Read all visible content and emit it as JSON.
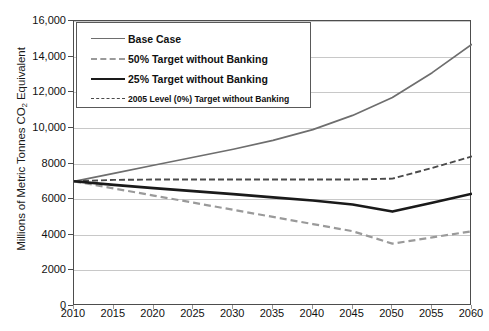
{
  "chart_data": {
    "type": "line",
    "title": "",
    "xlabel": "",
    "ylabel": "Millions of Metric Tonnes CO2 Equivalent",
    "ylabel_parts": {
      "pre": "Millions of Metric Tonnes CO",
      "sub": "2",
      "post": " Equivalent"
    },
    "xlim": [
      2010,
      2060
    ],
    "ylim": [
      0,
      16000
    ],
    "grid": true,
    "legend_position": "top-left-inside",
    "x": [
      2010,
      2015,
      2020,
      2025,
      2030,
      2035,
      2040,
      2045,
      2050,
      2055,
      2060
    ],
    "xticks": [
      "2010",
      "2015",
      "2020",
      "2025",
      "2030",
      "2035",
      "2040",
      "2045",
      "2050",
      "2055",
      "2060"
    ],
    "yticks": [
      "0",
      "2000",
      "4000",
      "6000",
      "8000",
      "10,000",
      "12,000",
      "14,000",
      "16,000"
    ],
    "ytick_values": [
      0,
      2000,
      4000,
      6000,
      8000,
      10000,
      12000,
      14000,
      16000
    ],
    "series": [
      {
        "name": "Base Case",
        "style": "solid",
        "color": "#6e6e6e",
        "width": 1.7,
        "values": [
          7000,
          7450,
          7900,
          8350,
          8800,
          9300,
          9900,
          10700,
          11700,
          13100,
          14700
        ]
      },
      {
        "name": "50% Target without Banking",
        "style": "dashed",
        "color": "#9a9a9a",
        "width": 2.2,
        "values": [
          7000,
          6600,
          6200,
          5800,
          5400,
          5000,
          4600,
          4200,
          3500,
          3850,
          4200
        ]
      },
      {
        "name": "25% Target without Banking",
        "style": "solid",
        "color": "#1a1a1a",
        "width": 2.6,
        "values": [
          7000,
          6800,
          6620,
          6450,
          6280,
          6100,
          5920,
          5700,
          5300,
          5800,
          6300
        ]
      },
      {
        "name": "2005 Level (0%) Target without Banking",
        "style": "dashed",
        "color": "#4a4a4a",
        "width": 1.9,
        "values": [
          7000,
          7080,
          7100,
          7100,
          7100,
          7100,
          7100,
          7100,
          7150,
          7750,
          8400
        ]
      }
    ]
  },
  "legend": {
    "items": [
      {
        "label": "Base Case",
        "swatch": "sw-base",
        "small": false
      },
      {
        "label": "50% Target without Banking",
        "swatch": "sw-50",
        "small": false
      },
      {
        "label": "25% Target without Banking",
        "swatch": "sw-25",
        "small": false
      },
      {
        "label": "2005 Level (0%) Target without Banking",
        "swatch": "sw-2005",
        "small": true
      }
    ]
  }
}
